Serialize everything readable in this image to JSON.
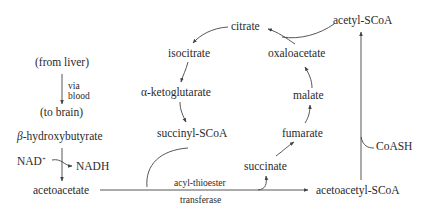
{
  "diagram": {
    "type": "metabolic-pathway",
    "left_branch": {
      "from_liver": "(from liver)",
      "via": "via",
      "blood": "blood",
      "to_brain": "(to brain)",
      "beta_prefix": "β",
      "hydroxybutyrate": "-hydroxybutyrate",
      "nad_plus": "NAD",
      "nad_plus_sup": "+",
      "nadh": "NADH",
      "acetoacetate": "acetoacetate"
    },
    "tca_cycle": {
      "citrate": "citrate",
      "isocitrate": "isocitrate",
      "alpha_prefix": "α",
      "ketoglutarate": "-ketoglutarate",
      "succinyl_scoa": "succinyl-SCoA",
      "succinate": "succinate",
      "fumarate": "fumarate",
      "malate": "malate",
      "oxaloacetate": "oxaloacetate",
      "acetyl_scoa": "acetyl-SCoA"
    },
    "enzyme": {
      "line1": "acyl-thioester",
      "line2": "transferase"
    },
    "right_branch": {
      "acetoacetyl_scoa": "acetoacetyl-SCoA",
      "coash": "CoASH"
    },
    "colors": {
      "text": "#2a2a2a",
      "lines": "#444444",
      "background": "#ffffff"
    }
  }
}
